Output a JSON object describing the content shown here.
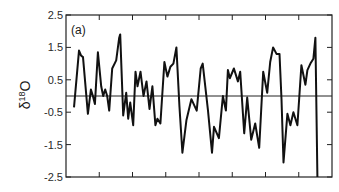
{
  "chart_data": {
    "type": "line",
    "title": "",
    "panel_label": "(a)",
    "xlabel": "",
    "ylabel": "δ18O",
    "ylabel_parts": {
      "prefix": "δ",
      "sup": "18",
      "suffix": "O"
    },
    "ylim": [
      -2.5,
      2.5
    ],
    "yticks": [
      2.5,
      1.5,
      0.5,
      -0.5,
      -1.5,
      -2.5
    ],
    "ytick_labels": [
      "2.5",
      "1.5",
      "0.5",
      "-0.5",
      "-1.5",
      "-2.5"
    ],
    "xlim": [
      0,
      8
    ],
    "xticks": [
      1,
      2,
      3,
      4,
      5,
      6,
      7
    ],
    "xtick_labels": [],
    "reference_line": 0,
    "grid": false,
    "legend": null,
    "series": [
      {
        "name": "δ18O",
        "color": "#111111",
        "x": [
          0.24,
          0.39,
          0.45,
          0.51,
          0.66,
          0.75,
          0.81,
          0.87,
          0.96,
          1.06,
          1.12,
          1.18,
          1.24,
          1.3,
          1.39,
          1.51,
          1.6,
          1.63,
          1.72,
          1.81,
          1.87,
          1.93,
          2.02,
          2.09,
          2.15,
          2.24,
          2.33,
          2.42,
          2.51,
          2.6,
          2.69,
          2.75,
          2.84,
          2.96,
          3.05,
          3.14,
          3.23,
          3.32,
          3.41,
          3.5,
          3.62,
          3.77,
          3.93,
          4.05,
          4.11,
          4.27,
          4.39,
          4.45,
          4.6,
          4.72,
          4.81,
          4.87,
          4.93,
          5.05,
          5.17,
          5.24,
          5.36,
          5.45,
          5.57,
          5.69,
          5.81,
          5.93,
          6.05,
          6.14,
          6.23,
          6.33,
          6.42,
          6.48,
          6.54,
          6.66,
          6.75,
          6.84,
          6.96,
          7.08,
          7.2,
          7.26,
          7.35,
          7.44,
          7.5,
          7.56
        ],
        "values": [
          -0.35,
          1.4,
          1.25,
          1.2,
          -0.55,
          0.2,
          0.0,
          -0.25,
          1.35,
          0.3,
          0.0,
          0.2,
          0.0,
          -0.45,
          0.85,
          1.1,
          1.8,
          1.9,
          -0.6,
          0.1,
          -0.7,
          -0.2,
          -0.9,
          0.75,
          0.3,
          0.75,
          0.0,
          0.45,
          -0.4,
          0.3,
          -0.9,
          -0.7,
          -0.85,
          1.05,
          0.6,
          0.9,
          1.0,
          1.5,
          -0.3,
          -1.75,
          -0.75,
          -0.1,
          -0.45,
          0.85,
          1.0,
          -0.45,
          -1.75,
          -0.95,
          -1.3,
          0.0,
          -0.45,
          0.8,
          0.55,
          0.85,
          0.45,
          0.75,
          -1.15,
          -0.05,
          -1.35,
          -0.85,
          -1.6,
          0.75,
          0.1,
          1.05,
          1.5,
          1.3,
          1.3,
          -0.1,
          -2.05,
          -0.55,
          -0.9,
          -0.5,
          -0.9,
          0.95,
          0.35,
          0.8,
          1.0,
          1.15,
          1.8,
          -2.5
        ]
      }
    ]
  }
}
